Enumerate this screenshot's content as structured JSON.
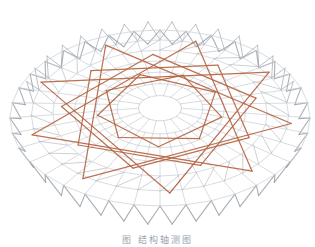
{
  "figure": {
    "colors": {
      "background": "#ffffff",
      "grid": "#c9ced4",
      "grid_dark": "#9aa1a9",
      "beam": "#b5603e"
    },
    "geometry": {
      "center_x": 160,
      "center_y": 118,
      "radius_x": 150,
      "radius_y": 88,
      "rings": 7,
      "radial_segments": 36,
      "star_points": 9,
      "skirt_depth": 26
    }
  },
  "caption": {
    "text": "图  结构轴测图",
    "visibility": "partially cut off at bottom edge"
  }
}
